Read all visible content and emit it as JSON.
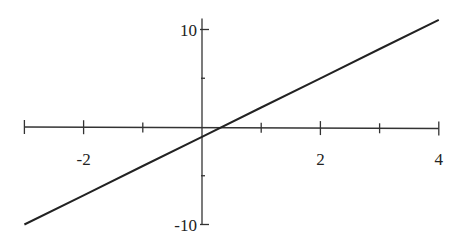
{
  "chart_data": {
    "type": "line",
    "title": "",
    "xlabel": "",
    "ylabel": "",
    "xlim": [
      -3,
      4
    ],
    "ylim": [
      -10,
      10
    ],
    "grid": false,
    "legend": null,
    "x_ticks": [
      -3,
      -2,
      -1,
      0,
      1,
      2,
      3,
      4
    ],
    "x_tick_labels": [
      {
        "value": -2,
        "label": "-2"
      },
      {
        "value": 2,
        "label": "2"
      },
      {
        "value": 4,
        "label": "4"
      }
    ],
    "y_ticks": [
      -10,
      -5,
      0,
      5,
      10
    ],
    "y_tick_labels": [
      {
        "value": 10,
        "label": "10"
      },
      {
        "value": -10,
        "label": "-10"
      }
    ],
    "series": [
      {
        "name": "y = 3x - 1",
        "x": [
          -3,
          -2,
          -1,
          0,
          1,
          2,
          3,
          4
        ],
        "y": [
          -10,
          -7,
          -4,
          -1,
          2,
          5,
          8,
          11
        ]
      }
    ]
  },
  "colors": {
    "axis": "#333333",
    "line": "#222222",
    "background": "#ffffff"
  }
}
